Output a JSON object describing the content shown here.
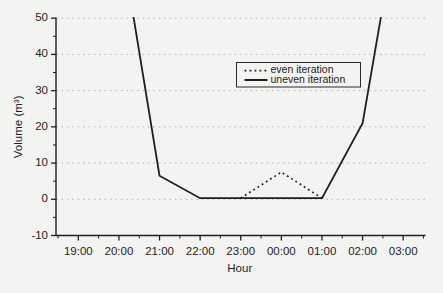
{
  "chart_data": {
    "type": "line",
    "title": "",
    "xlabel": "Hour",
    "ylabel": "Volume (m³)",
    "x_categories": [
      "19:00",
      "20:00",
      "21:00",
      "22:00",
      "23:00",
      "00:00",
      "01:00",
      "02:00",
      "03:00"
    ],
    "ylim": [
      -10,
      50
    ],
    "y_ticks": [
      -10,
      0,
      10,
      20,
      30,
      40,
      50
    ],
    "y_minor_tick_step": 5,
    "x_minor_ticks_at_half_hours": true,
    "grid": "horizontal-dashed-at-major-ticks-0-to-50",
    "legend": {
      "position": "inside-upper-right",
      "border": true,
      "entries": [
        {
          "label": "even iteration",
          "line_style": "dotted"
        },
        {
          "label": "uneven iteration",
          "line_style": "solid"
        }
      ]
    },
    "series": [
      {
        "name": "even iteration",
        "line_style": "dotted",
        "points": [
          {
            "x": "23:00",
            "y": 0.3
          },
          {
            "x": "00:00",
            "y": 7.5
          },
          {
            "x": "01:00",
            "y": 0.3
          }
        ]
      },
      {
        "name": "uneven iteration",
        "line_style": "solid",
        "points": [
          {
            "x": "20:00",
            "y": 75,
            "offscale_clipped_at_50": true
          },
          {
            "x": "21:00",
            "y": 6.5
          },
          {
            "x": "22:00",
            "y": 0.3
          },
          {
            "x": "23:00",
            "y": 0.3
          },
          {
            "x": "00:00",
            "y": 0.3
          },
          {
            "x": "01:00",
            "y": 0.3
          },
          {
            "x": "02:00",
            "y": 21
          },
          {
            "x": "03:00",
            "y": 86,
            "offscale_clipped_at_50": true
          }
        ]
      }
    ],
    "colors": {
      "line": "#1e1e1e",
      "grid": "#b9b9b5",
      "text": "#1d1d1d",
      "background": "#f3f3f1",
      "legend_border": "#2a2a2a"
    }
  }
}
